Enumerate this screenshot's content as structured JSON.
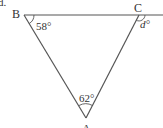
{
  "problem_label": "d.",
  "vertices": {
    "A": {
      "label": "A",
      "x": 86,
      "y": 118
    },
    "B": {
      "label": "B",
      "x": 24,
      "y": 15
    },
    "C": {
      "label": "C",
      "x": 139,
      "y": 15
    }
  },
  "line_extension_end_x": 163,
  "angles": {
    "B": {
      "label": "58°",
      "value": 58
    },
    "A": {
      "label": "62°",
      "value": 62
    },
    "C_exterior": {
      "label": "d°",
      "variable": "d"
    }
  },
  "colors": {
    "stroke": "#555555",
    "text": "#333333"
  }
}
